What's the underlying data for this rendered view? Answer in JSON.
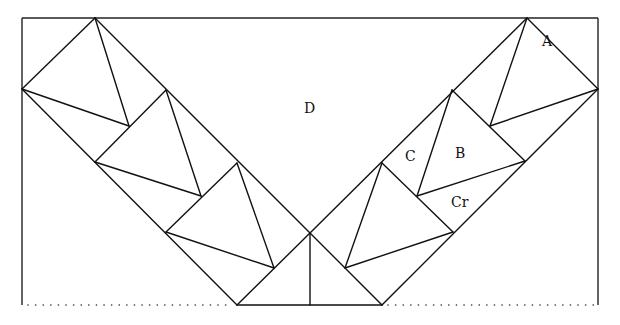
{
  "diagram": {
    "title": "",
    "labels": {
      "D": "D",
      "A": "A",
      "B": "B",
      "C": "C",
      "Cr": "Cr"
    }
  }
}
